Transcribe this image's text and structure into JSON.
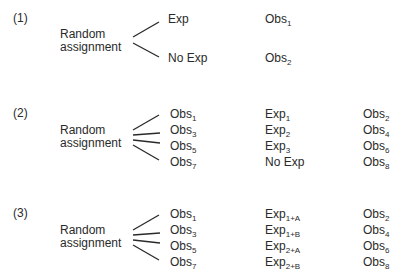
{
  "designs": [
    {
      "label": "(1)",
      "assignment": [
        "Random",
        "assignment"
      ],
      "branches": [
        {
          "group": "Exp",
          "obs": {
            "base": "Obs",
            "sub": "1"
          }
        },
        {
          "group": "No Exp",
          "obs": {
            "base": "Obs",
            "sub": "2"
          }
        }
      ]
    },
    {
      "label": "(2)",
      "assignment": [
        "Random",
        "assignment"
      ],
      "rows": [
        {
          "pre": {
            "base": "Obs",
            "sub": "1"
          },
          "treatment": {
            "base": "Exp",
            "sub": "1"
          },
          "post": {
            "base": "Obs",
            "sub": "2"
          }
        },
        {
          "pre": {
            "base": "Obs",
            "sub": "3"
          },
          "treatment": {
            "base": "Exp",
            "sub": "2"
          },
          "post": {
            "base": "Obs",
            "sub": "4"
          }
        },
        {
          "pre": {
            "base": "Obs",
            "sub": "5"
          },
          "treatment": {
            "base": "Exp",
            "sub": "3"
          },
          "post": {
            "base": "Obs",
            "sub": "6"
          }
        },
        {
          "pre": {
            "base": "Obs",
            "sub": "7"
          },
          "treatment": {
            "base": "No Exp",
            "sub": ""
          },
          "post": {
            "base": "Obs",
            "sub": "8"
          }
        }
      ]
    },
    {
      "label": "(3)",
      "assignment": [
        "Random",
        "assignment"
      ],
      "rows": [
        {
          "pre": {
            "base": "Obs",
            "sub": "1"
          },
          "treatment": {
            "base": "Exp",
            "sub": "1+A"
          },
          "post": {
            "base": "Obs",
            "sub": "2"
          }
        },
        {
          "pre": {
            "base": "Obs",
            "sub": "3"
          },
          "treatment": {
            "base": "Exp",
            "sub": "1+B"
          },
          "post": {
            "base": "Obs",
            "sub": "4"
          }
        },
        {
          "pre": {
            "base": "Obs",
            "sub": "5"
          },
          "treatment": {
            "base": "Exp",
            "sub": "2+A"
          },
          "post": {
            "base": "Obs",
            "sub": "6"
          }
        },
        {
          "pre": {
            "base": "Obs",
            "sub": "7"
          },
          "treatment": {
            "base": "Exp",
            "sub": "2+B"
          },
          "post": {
            "base": "Obs",
            "sub": "8"
          }
        }
      ]
    }
  ]
}
